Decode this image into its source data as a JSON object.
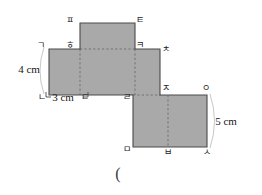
{
  "figure": {
    "fill_color": "#a9a9a9",
    "stroke_color": "#4a4a4a",
    "dash_color": "#6b6b6b",
    "background": "#ffffff"
  },
  "vertices": [
    {
      "id": "p",
      "label": "ㅍ",
      "x": 70,
      "y": 20
    },
    {
      "id": "t",
      "label": "ㅌ",
      "x": 140,
      "y": 20
    },
    {
      "id": "h",
      "label": "ㅎ",
      "x": 70,
      "y": 45
    },
    {
      "id": "k",
      "label": "ㅋ",
      "x": 140,
      "y": 45
    },
    {
      "id": "g",
      "label": "ㄱ",
      "x": 41,
      "y": 45
    },
    {
      "id": "ch",
      "label": "ㅊ",
      "x": 166,
      "y": 49
    },
    {
      "id": "n",
      "label": "ㄴ",
      "x": 42,
      "y": 97
    },
    {
      "id": "d",
      "label": "ㄷ",
      "x": 85,
      "y": 97
    },
    {
      "id": "r",
      "label": "ㄹ",
      "x": 127,
      "y": 97
    },
    {
      "id": "j",
      "label": "ㅈ",
      "x": 166,
      "y": 88
    },
    {
      "id": "o",
      "label": "ㅇ",
      "x": 206,
      "y": 88
    },
    {
      "id": "m",
      "label": "ㅁ",
      "x": 127,
      "y": 149
    },
    {
      "id": "b",
      "label": "ㅂ",
      "x": 168,
      "y": 152
    },
    {
      "id": "s",
      "label": "ㅅ",
      "x": 207,
      "y": 152
    }
  ],
  "dimensions": [
    {
      "id": "height-left",
      "text": "4 cm",
      "x": 29,
      "y": 69
    },
    {
      "id": "width-bottom",
      "text": "3 cm",
      "x": 63,
      "y": 97
    },
    {
      "id": "height-right",
      "text": "5 cm",
      "x": 226,
      "y": 121
    }
  ],
  "annotations": [
    {
      "id": "answer-paren",
      "text": "(",
      "x": 118,
      "y": 174
    }
  ]
}
